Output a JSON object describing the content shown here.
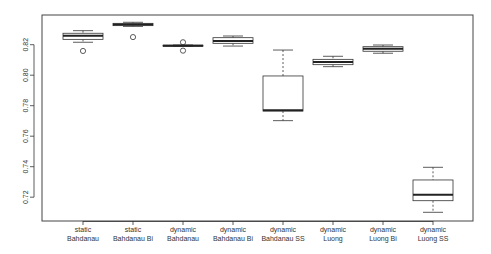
{
  "chart_data": {
    "type": "boxplot",
    "title": "",
    "xlabel": "",
    "ylabel": "",
    "ylim": [
      0.7045,
      0.8475
    ],
    "grid": false,
    "legend": null,
    "yticks": [
      0.72,
      0.74,
      0.76,
      0.78,
      0.8,
      0.82
    ],
    "ytick_labels": [
      "0.72",
      "0.74",
      "0.76",
      "0.78",
      "0.80",
      "0.82"
    ],
    "categories": [
      [
        "static",
        "Bahdanau"
      ],
      [
        "static",
        "Bahdanau Bi"
      ],
      [
        "dynamic",
        "Bahdanau"
      ],
      [
        "dynamic",
        "Bahdanau Bi"
      ],
      [
        "dynamic",
        "Bahdanau SS"
      ],
      [
        "dynamic",
        "Luong"
      ],
      [
        "dynamic",
        "Luong Bi"
      ],
      [
        "dynamic",
        "Luong SS"
      ]
    ],
    "boxes": [
      {
        "name": "static Bahdanau",
        "whisker_low": 0.8216,
        "q1": 0.8235,
        "median": 0.8259,
        "q3": 0.8275,
        "whisker_high": 0.8292,
        "outliers": [
          0.8159
        ]
      },
      {
        "name": "static Bahdanau Bi",
        "whisker_low": 0.832,
        "q1": 0.8325,
        "median": 0.8332,
        "q3": 0.834,
        "whisker_high": 0.8347,
        "outliers": [
          0.825
        ]
      },
      {
        "name": "dynamic Bahdanau",
        "whisker_low": 0.8189,
        "q1": 0.819,
        "median": 0.8193,
        "q3": 0.8197,
        "whisker_high": 0.8198,
        "outliers": [
          0.8216,
          0.8161
        ]
      },
      {
        "name": "dynamic Bahdanau Bi",
        "whisker_low": 0.8191,
        "q1": 0.8209,
        "median": 0.8224,
        "q3": 0.8246,
        "whisker_high": 0.8257,
        "outliers": []
      },
      {
        "name": "dynamic Bahdanau SS",
        "whisker_low": 0.7702,
        "q1": 0.7765,
        "median": 0.777,
        "q3": 0.7995,
        "whisker_high": 0.8165,
        "outliers": []
      },
      {
        "name": "dynamic Luong",
        "whisker_low": 0.8056,
        "q1": 0.8069,
        "median": 0.8087,
        "q3": 0.8104,
        "whisker_high": 0.8124,
        "outliers": []
      },
      {
        "name": "dynamic Luong Bi",
        "whisker_low": 0.8144,
        "q1": 0.8157,
        "median": 0.8174,
        "q3": 0.8187,
        "whisker_high": 0.8198,
        "outliers": []
      },
      {
        "name": "dynamic Luong SS",
        "whisker_low": 0.7101,
        "q1": 0.7177,
        "median": 0.7216,
        "q3": 0.7313,
        "whisker_high": 0.7396,
        "outliers": []
      }
    ]
  },
  "style": {
    "line_color": "#333333",
    "box_fill": "#ffffff",
    "frame_color": "#444444"
  }
}
